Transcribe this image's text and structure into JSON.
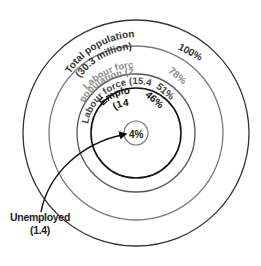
{
  "diagram": {
    "type": "nested-circles",
    "center": [
      136,
      133
    ],
    "circles": [
      {
        "id": "total-population",
        "label_line1": "Total population",
        "label_line2": "(30.3 million)",
        "value_millions": 30.3,
        "percent": "100%",
        "radius": 113,
        "stroke": "#333333",
        "text_color": "#333333"
      },
      {
        "id": "labour-force-population",
        "label_line1": "Labour force",
        "label_line2": "population (23.6)",
        "value_millions": 23.6,
        "percent": "78%",
        "radius": 87,
        "stroke": "#7a7a7a",
        "text_color": "#8a8a8a"
      },
      {
        "id": "labour-force",
        "label_line1": "Labour force (15.4)",
        "value_millions": 15.4,
        "percent": "51%",
        "radius": 59,
        "stroke": "#555555",
        "text_color": "#444444"
      },
      {
        "id": "employed",
        "label_line1": "Employed",
        "label_line2": "(14)",
        "value_millions": 14,
        "percent": "46%",
        "radius": 45,
        "stroke": "#111111",
        "text_color": "#111111"
      },
      {
        "id": "unemployed",
        "percent": "4%",
        "value_millions": 1.4,
        "radius": 12,
        "stroke": "#777777",
        "text_color": "#222222"
      }
    ],
    "callout": {
      "label_line1": "Unemployed",
      "label_line2": "(1.4)"
    }
  }
}
